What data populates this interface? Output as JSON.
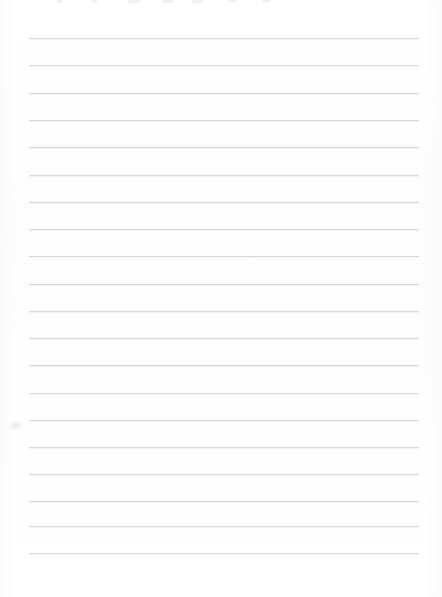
{
  "document": {
    "kind": "scanned-blank-ruled-notepad-page",
    "title": "",
    "body_text": "",
    "width_px": 442,
    "height_px": 597,
    "background_color": "#fefefe",
    "has_handwriting": false,
    "has_printed_text": false
  },
  "ruling": {
    "line_color": "#d9d9dd",
    "line_halo_color": "#f1f1f3",
    "line_thickness_px": 1,
    "line_left_px": 29,
    "line_right_px": 419,
    "line_width_px": 390,
    "first_line_y_px": 38,
    "line_spacing_px": 27.2,
    "line_count": 20,
    "line_y_positions": [
      38,
      65,
      93,
      120,
      147,
      175,
      202,
      229,
      256,
      284,
      311,
      338,
      365,
      393,
      420,
      447,
      474,
      501,
      526,
      553
    ]
  },
  "artifacts": {
    "top_edge_marks_color": "#e9e9ee",
    "top_edge_marks": [
      {
        "x": 57,
        "width": 5,
        "height": 3
      },
      {
        "x": 92,
        "width": 5,
        "height": 3
      },
      {
        "x": 128,
        "width": 12,
        "height": 3
      },
      {
        "x": 162,
        "width": 11,
        "height": 3
      },
      {
        "x": 192,
        "width": 11,
        "height": 3
      },
      {
        "x": 228,
        "width": 9,
        "height": 2
      },
      {
        "x": 262,
        "width": 8,
        "height": 2
      }
    ],
    "margin_smudge": {
      "x": 9,
      "y": 421,
      "width": 13,
      "height": 9,
      "color": "#e6e6ea"
    }
  },
  "labels": {
    "page_role": "Blank lined paper scan",
    "ruled_area": "Ruled writing area",
    "left_margin": "Left margin",
    "top_edge": "Top edge scan artifacts"
  }
}
